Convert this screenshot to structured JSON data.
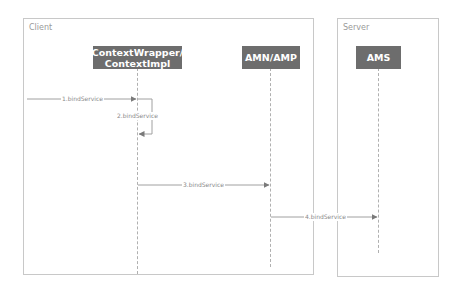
{
  "frames": {
    "client": {
      "label": "Client"
    },
    "server": {
      "label": "Server"
    }
  },
  "actors": [
    {
      "id": "contextwrapper",
      "label_line1": "ContextWrapper/",
      "label_line2": "ContextImpl"
    },
    {
      "id": "amn",
      "label": "AMN/AMP"
    },
    {
      "id": "ams",
      "label": "AMS"
    }
  ],
  "messages": [
    {
      "label": "1.bindService",
      "from": "external",
      "to": "ContextWrapper/ContextImpl"
    },
    {
      "label": "2.bindService",
      "from": "ContextWrapper/ContextImpl",
      "to": "ContextWrapper/ContextImpl"
    },
    {
      "label": "3.bindService",
      "from": "ContextWrapper/ContextImpl",
      "to": "AMN/AMP"
    },
    {
      "label": "4.bindService",
      "from": "AMN/AMP",
      "to": "AMS"
    }
  ],
  "colors": {
    "actor_fill": "#6d6d6d",
    "line": "#a0a0a0",
    "frame_border": "#c8c8c8"
  }
}
